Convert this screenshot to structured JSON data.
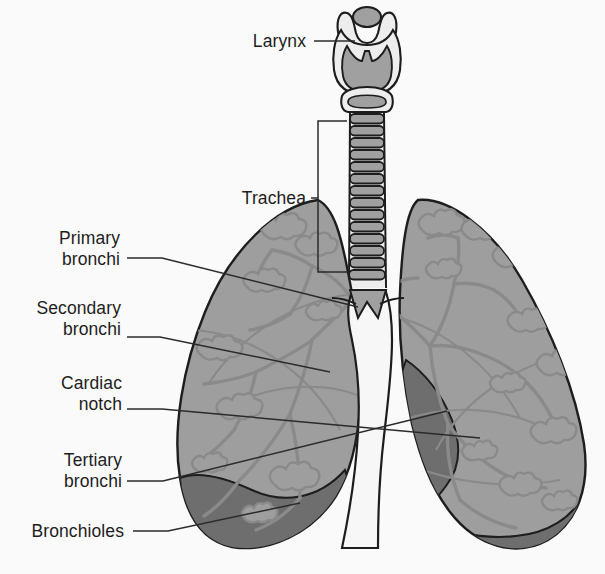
{
  "figure": {
    "background_color": "#fafafa",
    "style": "grayscale line illustration"
  },
  "palette": {
    "background": "#fafafa",
    "lung_fill": "#9e9e9e",
    "lung_fill_light": "#a8a8a8",
    "lung_shadow_dark": "#6e6e6e",
    "lung_outline": "#1d1d1d",
    "bronchi_tree_line": "#8a8a8a",
    "cartilage_fill": "#a0a0a0",
    "cartilage_light": "#ededed",
    "mediastinum_white": "#f7f7f7",
    "leader_line": "#2b2b2b",
    "text": "#1d1d1d"
  },
  "labels": [
    {
      "id": "larynx",
      "text": "Larynx",
      "lines": [
        "Larynx"
      ],
      "x": 222,
      "y": 31,
      "width": 84,
      "leader": {
        "from_x": 314,
        "from_y": 41,
        "to_x": 355,
        "to_y": 41,
        "type": "straight"
      }
    },
    {
      "id": "trachea",
      "text": "Trachea",
      "lines": [
        "Trachea"
      ],
      "x": 214,
      "y": 188,
      "width": 92,
      "leader": {
        "from_x": 312,
        "from_y": 198,
        "to_x": 318,
        "to_y": 198,
        "type": "bracket"
      },
      "bracket": {
        "x": 318,
        "top_y": 121,
        "bottom_y": 272,
        "arm_x": 347
      }
    },
    {
      "id": "primary-bronchi",
      "text": "Primary bronchi",
      "lines": [
        "Primary",
        "bronchi"
      ],
      "x": 44,
      "y": 228,
      "width": 76,
      "leader": {
        "from_x": 127,
        "from_y": 258,
        "to_x": 358,
        "to_y": 307,
        "type": "elbow",
        "elbow_x": 162,
        "elbow_y": 258
      }
    },
    {
      "id": "secondary-bronchi",
      "text": "Secondary bronchi",
      "lines": [
        "Secondary",
        "bronchi"
      ],
      "x": 25,
      "y": 298,
      "width": 96,
      "leader": {
        "from_x": 127,
        "from_y": 337,
        "to_x": 330,
        "to_y": 372,
        "type": "elbow",
        "elbow_x": 160,
        "elbow_y": 337
      }
    },
    {
      "id": "cardiac-notch",
      "text": "Cardiac notch",
      "lines": [
        "Cardiac",
        "notch"
      ],
      "x": 45,
      "y": 373,
      "width": 77,
      "leader": {
        "from_x": 127,
        "from_y": 409,
        "to_x": 480,
        "to_y": 438,
        "type": "elbow",
        "elbow_x": 162,
        "elbow_y": 409
      }
    },
    {
      "id": "tertiary-bronchi",
      "text": "Tertiary bronchi",
      "lines": [
        "Tertiary",
        "bronchi"
      ],
      "x": 45,
      "y": 450,
      "width": 77,
      "leader": {
        "from_x": 127,
        "from_y": 481,
        "to_x": 447,
        "to_y": 411,
        "type": "elbow",
        "elbow_x": 163,
        "elbow_y": 481
      }
    },
    {
      "id": "bronchioles",
      "text": "Bronchioles",
      "lines": [
        "Bronchioles"
      ],
      "x": 20,
      "y": 521,
      "width": 104,
      "leader": {
        "from_x": 133,
        "from_y": 531,
        "to_x": 300,
        "to_y": 503,
        "type": "elbow",
        "elbow_x": 168,
        "elbow_y": 531
      }
    }
  ],
  "anatomy": {
    "larynx": {
      "name": "larynx",
      "parts": [
        "hyoid horns",
        "epiglottis",
        "thyroid cartilage",
        "cricoid cartilage"
      ],
      "center_x": 367,
      "top_y": 8,
      "bottom_y": 112
    },
    "trachea": {
      "name": "trachea",
      "ring_count": 14,
      "center_x": 367,
      "top_y": 113,
      "bottom_y": 290,
      "half_width": 16
    },
    "carina": {
      "name": "carina",
      "x": 367,
      "y": 303
    },
    "left_lung": {
      "name": "left lung (viewer left)",
      "lobes": 2,
      "bounds": {
        "x1": 176,
        "y1": 197,
        "x2": 360,
        "y2": 548
      }
    },
    "right_lung": {
      "name": "right lung (viewer right)",
      "lobes": 3,
      "bounds": {
        "x1": 375,
        "y1": 197,
        "x2": 588,
        "y2": 548
      }
    },
    "cardiac_notch": {
      "name": "cardiac notch",
      "side": "viewer right lung, medial inferior border",
      "fill": "#6e6e6e"
    },
    "diaphragmatic_border": {
      "name": "inferior diaphragmatic border shading",
      "fill": "#6e6e6e"
    }
  }
}
